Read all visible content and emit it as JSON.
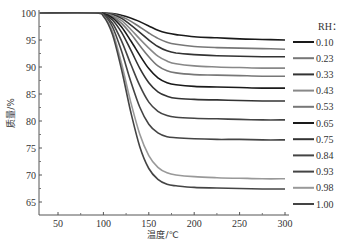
{
  "chart_data": {
    "type": "line",
    "title": "",
    "xlabel": "温度/℃",
    "ylabel": "质量/%",
    "xlim": [
      30,
      300
    ],
    "ylim": [
      63,
      100
    ],
    "xticks": [
      50,
      100,
      150,
      200,
      250,
      300
    ],
    "yticks": [
      65,
      70,
      75,
      80,
      85,
      90,
      95,
      100
    ],
    "grid": false,
    "legend": {
      "title": "RH：",
      "position": "right"
    },
    "x": [
      30,
      90,
      100,
      110,
      120,
      130,
      140,
      150,
      160,
      170,
      180,
      200,
      225,
      250,
      275,
      300
    ],
    "series": [
      {
        "name": "0.10",
        "color": "#1a1a1a",
        "values": [
          100,
          100,
          100,
          99.9,
          99.6,
          99.1,
          98.4,
          97.6,
          96.8,
          96.3,
          96.0,
          95.6,
          95.4,
          95.2,
          95.1,
          95.0
        ]
      },
      {
        "name": "0.23",
        "color": "#777777",
        "values": [
          100,
          100,
          100,
          99.8,
          99.3,
          98.5,
          97.4,
          96.3,
          95.3,
          94.6,
          94.2,
          93.8,
          93.6,
          93.5,
          93.4,
          93.3
        ]
      },
      {
        "name": "0.33",
        "color": "#333333",
        "values": [
          100,
          100,
          100,
          99.7,
          99.0,
          97.8,
          96.4,
          95.0,
          93.8,
          93.0,
          92.6,
          92.3,
          92.1,
          92.0,
          91.9,
          91.9
        ]
      },
      {
        "name": "0.43",
        "color": "#888888",
        "values": [
          100,
          100,
          99.9,
          99.5,
          98.6,
          97.0,
          95.2,
          93.5,
          92.0,
          91.1,
          90.6,
          90.2,
          90.0,
          89.9,
          89.8,
          89.8
        ]
      },
      {
        "name": "0.53",
        "color": "#777777",
        "values": [
          100,
          100,
          99.9,
          99.3,
          98.1,
          96.2,
          94.0,
          91.9,
          90.2,
          89.3,
          88.9,
          88.6,
          88.5,
          88.4,
          88.3,
          88.3
        ]
      },
      {
        "name": "0.65",
        "color": "#1a1a1a",
        "values": [
          100,
          100,
          99.9,
          99.1,
          97.4,
          94.9,
          92.2,
          89.7,
          88.0,
          87.1,
          86.7,
          86.4,
          86.3,
          86.2,
          86.1,
          86.1
        ]
      },
      {
        "name": "0.75",
        "color": "#333333",
        "values": [
          100,
          100,
          99.8,
          98.7,
          96.4,
          93.2,
          89.8,
          87.1,
          85.4,
          84.6,
          84.2,
          84.0,
          83.9,
          83.8,
          83.7,
          83.7
        ]
      },
      {
        "name": "0.84",
        "color": "#444444",
        "values": [
          100,
          100,
          99.7,
          98.1,
          94.8,
          90.6,
          86.6,
          83.5,
          81.8,
          81.0,
          80.7,
          80.5,
          80.4,
          80.3,
          80.2,
          80.2
        ]
      },
      {
        "name": "0.93",
        "color": "#444444",
        "values": [
          100,
          100,
          99.6,
          97.4,
          92.9,
          87.4,
          82.6,
          79.4,
          77.8,
          77.1,
          76.9,
          76.7,
          76.6,
          76.6,
          76.5,
          76.5
        ]
      },
      {
        "name": "0.98",
        "color": "#999999",
        "values": [
          100,
          100,
          99.5,
          96.6,
          90.6,
          83.6,
          77.6,
          73.6,
          71.4,
          70.4,
          70.0,
          69.7,
          69.5,
          69.4,
          69.3,
          69.3
        ]
      },
      {
        "name": "1.00",
        "color": "#444444",
        "values": [
          100,
          100,
          99.4,
          96.0,
          89.5,
          81.8,
          75.3,
          71.2,
          69.2,
          68.3,
          68.0,
          67.7,
          67.6,
          67.5,
          67.4,
          67.4
        ]
      }
    ]
  }
}
